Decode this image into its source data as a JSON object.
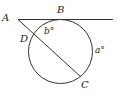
{
  "diagram": {
    "points": {
      "A": "A",
      "B": "B",
      "C": "C",
      "D": "D"
    },
    "angles": {
      "b": "b°",
      "a": "a°"
    },
    "circle": {
      "cx": 60.5,
      "cy": 51.5,
      "r": 32
    },
    "tangent_line": {
      "x1": 18,
      "y1": 19.5,
      "x2": 113,
      "y2": 19.5
    },
    "secant_line": {
      "x1": 18,
      "y1": 19.5,
      "x2": 81,
      "y2": 77
    },
    "stroke_color": "#333333"
  }
}
